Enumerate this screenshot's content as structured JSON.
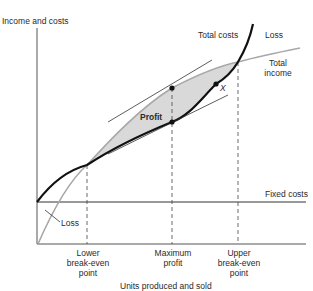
{
  "diagram": {
    "y_axis_label": "Income and costs",
    "x_axis_label": "Units produced and sold",
    "curves": {
      "total_costs": "Total costs",
      "total_income_line1": "Total",
      "total_income_line2": "income",
      "fixed_costs": "Fixed costs"
    },
    "regions": {
      "loss_upper": "Loss",
      "loss_lower": "Loss",
      "profit": "Profit"
    },
    "points": {
      "x_marker": "X",
      "lower_break_even": [
        "Lower",
        "break-even",
        "point"
      ],
      "maximum_profit": [
        "Maximum",
        "profit"
      ],
      "upper_break_even": [
        "Upper",
        "break-even",
        "point"
      ]
    },
    "colors": {
      "total_costs": "#111111",
      "total_income": "#a8a8a8",
      "profit_fill": "#d9d9d9",
      "axes": "#555555"
    }
  }
}
